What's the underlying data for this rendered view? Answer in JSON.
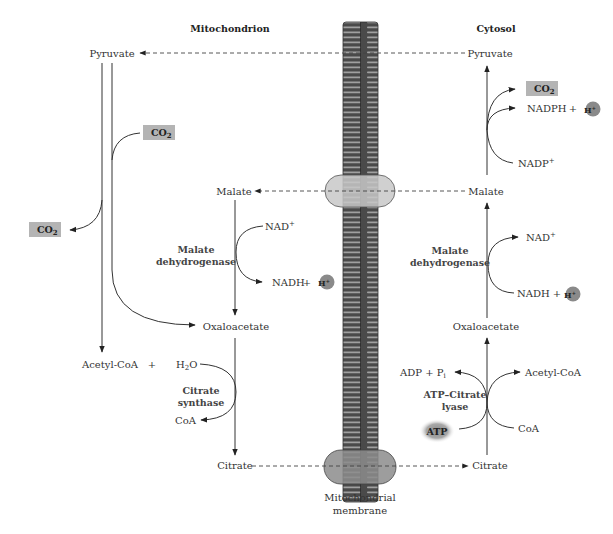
{
  "headers": {
    "mitochondrion": "Mitochondrion",
    "cytosol": "Cytosol"
  },
  "membrane": {
    "label_line1": "Mitochondrial",
    "label_line2": "membrane",
    "colors": {
      "membrane_dark": "#4a4a4a",
      "membrane_stripe": "#9a9a9a",
      "upper_transporter": "#c8c8c8",
      "lower_transporter": "#8c8c8c"
    }
  },
  "mitochondrion": {
    "pyruvate": "Pyruvate",
    "co2_in": "CO",
    "co2_in_sub": "2",
    "co2_out": "CO",
    "co2_out_sub": "2",
    "malate": "Malate",
    "nad_plus": "NAD",
    "nad_plus_sup": "+",
    "enzyme_mdh_line1": "Malate",
    "enzyme_mdh_line2": "dehydrogenase",
    "nadh": "NADH",
    "plus": "+",
    "h_plus": "H",
    "h_plus_sup": "+",
    "oxaloacetate": "Oxaloacetate",
    "acetyl_coa": "Acetyl-CoA",
    "plus2": "+",
    "h2o": "H",
    "h2o_sub": "2",
    "h2o_o": "O",
    "enzyme_cs_line1": "Citrate",
    "enzyme_cs_line2": "synthase",
    "coa": "CoA",
    "citrate": "Citrate"
  },
  "cytosol": {
    "pyruvate": "Pyruvate",
    "co2": "CO",
    "co2_sub": "2",
    "nadph": "NADPH",
    "plus": "+",
    "h_plus": "H",
    "h_plus_sup": "+",
    "nadp_plus": "NADP",
    "nadp_plus_sup": "+",
    "malate": "Malate",
    "nad_plus": "NAD",
    "nad_plus_sup": "+",
    "enzyme_mdh_line1": "Malate",
    "enzyme_mdh_line2": "dehydrogenase",
    "nadh": "NADH",
    "plus2": "+",
    "h_plus2": "H",
    "h_plus2_sup": "+",
    "oxaloacetate": "Oxaloacetate",
    "adp": "ADP + P",
    "adp_sub": "i",
    "acetyl_coa": "Acetyl-CoA",
    "enzyme_acl_line1": "ATP–Citrate",
    "enzyme_acl_line2": "lyase",
    "atp": "ATP",
    "coa": "CoA",
    "citrate": "Citrate"
  },
  "colors": {
    "co2_box": "#b4b4b4",
    "h_circle": "#8a8a8a",
    "atp_glow": "#9a9a9a"
  }
}
